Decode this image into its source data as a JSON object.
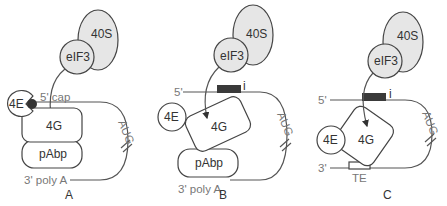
{
  "diagram": {
    "colors": {
      "ribosome_fill": "#e6e6e6",
      "outline": "#444444",
      "ires_box": "#3a3a3a",
      "mrna_line": "#555555"
    },
    "panels": [
      {
        "id": "A",
        "label": "A",
        "subunit": "40S",
        "factor": "eIF3",
        "cap_binding": "4E",
        "cap_label": "5' cap",
        "scaffold": "4G",
        "polyA_binding": "pAbp",
        "start_codon": "AUG",
        "tail_label": "3' poly A"
      },
      {
        "id": "B",
        "label": "B",
        "subunit": "40S",
        "factor": "eIF3",
        "five_prime": "5'",
        "element": "i",
        "cap_binding": "4E",
        "scaffold": "4G",
        "polyA_binding": "pAbp",
        "start_codon": "AUG",
        "tail_label": "3' poly A"
      },
      {
        "id": "C",
        "label": "C",
        "subunit": "40S",
        "factor": "eIF3",
        "five_prime": "5'",
        "element": "i",
        "cap_binding": "4E",
        "scaffold": "4G",
        "start_codon": "AUG",
        "three_prime": "3'",
        "translation_element": "TE"
      }
    ]
  }
}
